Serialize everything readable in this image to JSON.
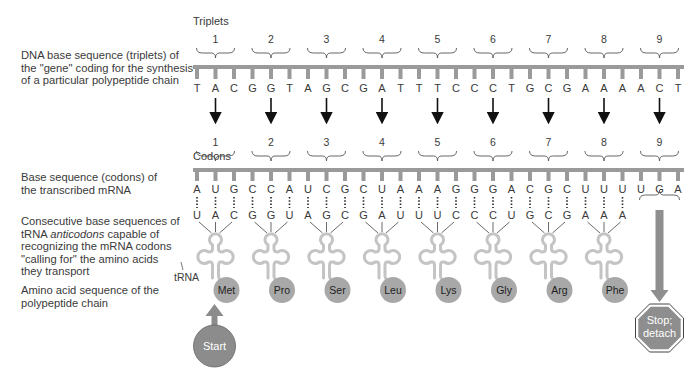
{
  "labels": {
    "dna": "DNA base sequence (triplets) of the \"gene\" coding for the synthesis of a particular polypeptide chain",
    "mrna": "Base sequence (codons) of the transcribed mRNA",
    "trna_pre": "Consecutive base sequences of tRNA ",
    "trna_em": "anticodons",
    "trna_post": " capable of recognizing the mRNA codons \"calling for\" the amino acids they transport",
    "amino": "Amino acid sequence of the polypeptide chain"
  },
  "headings": {
    "triplets": "Triplets",
    "codons": "Codons",
    "trna": "tRNA"
  },
  "dna_triplets": [
    "TAC",
    "GGT",
    "AGC",
    "GAT",
    "TTC",
    "CCT",
    "GCG",
    "AAA",
    "ACT"
  ],
  "mrna_codons": [
    "AUG",
    "CCA",
    "UCG",
    "CUA",
    "AAG",
    "GGA",
    "CGC",
    "UUU",
    "UGA"
  ],
  "anticodons": [
    "UAC",
    "GGU",
    "AGC",
    "GAU",
    "UUC",
    "CCU",
    "GCG",
    "AAA"
  ],
  "amino_acids": [
    "Met",
    "Pro",
    "Ser",
    "Leu",
    "Lys",
    "Gly",
    "Arg",
    "Phe"
  ],
  "numbers": [
    "1",
    "2",
    "3",
    "4",
    "5",
    "6",
    "7",
    "8",
    "9"
  ],
  "start": {
    "label": "Start"
  },
  "stop": {
    "line1": "Stop;",
    "line2": "detach"
  },
  "colors": {
    "backbone": "#9a9a9a",
    "trna": "#c4c4c4",
    "amino": "#a8a8a8",
    "start": "#8c8c8c",
    "stop": "#8e8e8e",
    "text": "#3a3a3a"
  }
}
